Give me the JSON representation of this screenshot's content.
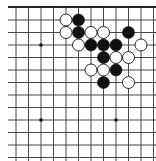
{
  "board": {
    "description": "Go board fragment (top edge visible)",
    "line_color": "#333333",
    "edge_color": "#222222",
    "background": "#ffffff",
    "columns_x": [
      16,
      28.5,
      41,
      53.5,
      66,
      78.5,
      91,
      103.5,
      116,
      128.5,
      141,
      153.5
    ],
    "rows_y": [
      7,
      20,
      32.5,
      45,
      57.5,
      70,
      82.5,
      95,
      107.5,
      120,
      132.5,
      145,
      157.5
    ],
    "line_x_start": 8,
    "line_x_end": 156,
    "star_points": [
      {
        "col": 2,
        "row": 3
      },
      {
        "col": 2,
        "row": 9
      },
      {
        "col": 8,
        "row": 9
      }
    ],
    "stones": [
      {
        "color": "white",
        "col": 4,
        "row": 1
      },
      {
        "color": "black",
        "col": 5,
        "row": 1
      },
      {
        "color": "white",
        "col": 4,
        "row": 2
      },
      {
        "color": "black",
        "col": 5,
        "row": 2
      },
      {
        "color": "white",
        "col": 6,
        "row": 2
      },
      {
        "color": "white",
        "col": 7,
        "row": 2
      },
      {
        "color": "black",
        "col": 9,
        "row": 2
      },
      {
        "color": "white",
        "col": 5,
        "row": 3
      },
      {
        "color": "black",
        "col": 6,
        "row": 3
      },
      {
        "color": "black",
        "col": 7,
        "row": 3
      },
      {
        "color": "black",
        "col": 8,
        "row": 3
      },
      {
        "color": "white",
        "col": 10,
        "row": 3
      },
      {
        "color": "black",
        "col": 7,
        "row": 4
      },
      {
        "color": "white",
        "col": 8,
        "row": 4
      },
      {
        "color": "white",
        "col": 9,
        "row": 4
      },
      {
        "color": "white",
        "col": 6,
        "row": 5
      },
      {
        "color": "white",
        "col": 7,
        "row": 5
      },
      {
        "color": "black",
        "col": 8,
        "row": 5
      },
      {
        "color": "black",
        "col": 7,
        "row": 6
      },
      {
        "color": "white",
        "col": 9,
        "row": 6
      }
    ],
    "stone_radius": 6
  }
}
